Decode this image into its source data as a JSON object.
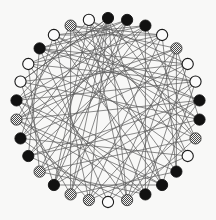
{
  "figure": {
    "background_color": "#f8f8f7",
    "width": 216,
    "height": 220
  },
  "chart_data": {
    "type": "diagram",
    "subtype": "circular-node-link-graph",
    "layout": "circle",
    "center": [
      108,
      110
    ],
    "radius": 92,
    "node_radius": 5.6,
    "node_count": 30,
    "edge_count": 78,
    "grid": false,
    "legend": null,
    "node_styles": {
      "black": {
        "fill": "#111111",
        "stroke": "#111111",
        "label": "solid-black"
      },
      "white": {
        "fill": "#fbfbfb",
        "stroke": "#1a1a1a",
        "label": "open-white"
      },
      "hatched": {
        "fill": "#9a9a9a",
        "stroke": "#3a3a3a",
        "label": "gray-checkered"
      }
    },
    "edge_style": {
      "color": "#5a5a5a",
      "width": 0.7
    },
    "nodes": [
      {
        "id": 0,
        "angle": -90,
        "type": "black",
        "x": 108.0,
        "y": 18.0
      },
      {
        "id": 1,
        "angle": -78,
        "type": "black",
        "x": 127.1,
        "y": 19.9
      },
      {
        "id": 2,
        "angle": -66,
        "type": "black",
        "x": 145.4,
        "y": 25.6
      },
      {
        "id": 3,
        "angle": -54,
        "type": "white",
        "x": 162.1,
        "y": 35.0
      },
      {
        "id": 4,
        "angle": -42,
        "type": "hatched",
        "x": 176.4,
        "y": 48.4
      },
      {
        "id": 5,
        "angle": -30,
        "type": "white",
        "x": 187.7,
        "y": 64.0
      },
      {
        "id": 6,
        "angle": -18,
        "type": "white",
        "x": 195.5,
        "y": 81.6
      },
      {
        "id": 7,
        "angle": -6,
        "type": "black",
        "x": 199.5,
        "y": 100.4
      },
      {
        "id": 8,
        "angle": 6,
        "type": "black",
        "x": 199.5,
        "y": 119.6
      },
      {
        "id": 9,
        "angle": 18,
        "type": "hatched",
        "x": 195.5,
        "y": 138.4
      },
      {
        "id": 10,
        "angle": 30,
        "type": "white",
        "x": 187.7,
        "y": 156.0
      },
      {
        "id": 11,
        "angle": 42,
        "type": "black",
        "x": 176.4,
        "y": 171.6
      },
      {
        "id": 12,
        "angle": 54,
        "type": "black",
        "x": 162.1,
        "y": 185.0
      },
      {
        "id": 13,
        "angle": 66,
        "type": "black",
        "x": 145.4,
        "y": 194.4
      },
      {
        "id": 14,
        "angle": 78,
        "type": "hatched",
        "x": 127.1,
        "y": 200.1
      },
      {
        "id": 15,
        "angle": 90,
        "type": "white",
        "x": 108.0,
        "y": 202.0
      },
      {
        "id": 16,
        "angle": 102,
        "type": "hatched",
        "x": 88.9,
        "y": 200.1
      },
      {
        "id": 17,
        "angle": 114,
        "type": "hatched",
        "x": 70.6,
        "y": 194.4
      },
      {
        "id": 18,
        "angle": 126,
        "type": "black",
        "x": 53.9,
        "y": 185.0
      },
      {
        "id": 19,
        "angle": 138,
        "type": "hatched",
        "x": 39.6,
        "y": 171.6
      },
      {
        "id": 20,
        "angle": 150,
        "type": "black",
        "x": 28.3,
        "y": 156.0
      },
      {
        "id": 21,
        "angle": 162,
        "type": "black",
        "x": 20.5,
        "y": 138.4
      },
      {
        "id": 22,
        "angle": 174,
        "type": "hatched",
        "x": 16.5,
        "y": 119.6
      },
      {
        "id": 23,
        "angle": 186,
        "type": "black",
        "x": 16.5,
        "y": 100.4
      },
      {
        "id": 24,
        "angle": 198,
        "type": "white",
        "x": 20.5,
        "y": 81.6
      },
      {
        "id": 25,
        "angle": 210,
        "type": "white",
        "x": 28.3,
        "y": 64.0
      },
      {
        "id": 26,
        "angle": 222,
        "type": "black",
        "x": 39.6,
        "y": 48.4
      },
      {
        "id": 27,
        "angle": 234,
        "type": "white",
        "x": 53.9,
        "y": 35.0
      },
      {
        "id": 28,
        "angle": 246,
        "type": "hatched",
        "x": 70.6,
        "y": 25.6
      },
      {
        "id": 29,
        "angle": 258,
        "type": "white",
        "x": 88.9,
        "y": 19.9
      }
    ],
    "edges": [
      [
        0,
        9
      ],
      [
        0,
        12
      ],
      [
        0,
        14
      ],
      [
        0,
        16
      ],
      [
        0,
        18
      ],
      [
        0,
        21
      ],
      [
        0,
        24
      ],
      [
        1,
        10
      ],
      [
        1,
        17
      ],
      [
        1,
        22
      ],
      [
        1,
        26
      ],
      [
        2,
        13
      ],
      [
        2,
        19
      ],
      [
        2,
        23
      ],
      [
        2,
        27
      ],
      [
        3,
        11
      ],
      [
        3,
        16
      ],
      [
        3,
        20
      ],
      [
        3,
        25
      ],
      [
        3,
        28
      ],
      [
        4,
        8
      ],
      [
        4,
        14
      ],
      [
        4,
        18
      ],
      [
        4,
        22
      ],
      [
        5,
        13
      ],
      [
        5,
        17
      ],
      [
        5,
        21
      ],
      [
        5,
        26
      ],
      [
        6,
        12
      ],
      [
        6,
        16
      ],
      [
        6,
        19
      ],
      [
        6,
        23
      ],
      [
        6,
        29
      ],
      [
        7,
        14
      ],
      [
        7,
        18
      ],
      [
        7,
        22
      ],
      [
        7,
        27
      ],
      [
        8,
        15
      ],
      [
        8,
        20
      ],
      [
        8,
        24
      ],
      [
        8,
        28
      ],
      [
        9,
        14
      ],
      [
        9,
        19
      ],
      [
        9,
        25
      ],
      [
        10,
        16
      ],
      [
        10,
        21
      ],
      [
        10,
        26
      ],
      [
        11,
        17
      ],
      [
        11,
        23
      ],
      [
        11,
        28
      ],
      [
        12,
        18
      ],
      [
        12,
        22
      ],
      [
        12,
        27
      ],
      [
        12,
        29
      ],
      [
        13,
        19
      ],
      [
        13,
        24
      ],
      [
        13,
        28
      ],
      [
        14,
        20
      ],
      [
        14,
        25
      ],
      [
        14,
        29
      ],
      [
        15,
        21
      ],
      [
        15,
        26
      ],
      [
        16,
        22
      ],
      [
        16,
        27
      ],
      [
        17,
        23
      ],
      [
        17,
        28
      ],
      [
        17,
        0
      ],
      [
        18,
        24
      ],
      [
        18,
        29
      ],
      [
        18,
        1
      ],
      [
        19,
        25
      ],
      [
        19,
        0
      ],
      [
        20,
        26
      ],
      [
        20,
        1
      ],
      [
        21,
        27
      ],
      [
        21,
        2
      ],
      [
        22,
        28
      ],
      [
        22,
        3
      ],
      [
        23,
        29
      ],
      [
        23,
        4
      ],
      [
        24,
        0
      ],
      [
        24,
        5
      ],
      [
        25,
        1
      ],
      [
        25,
        6
      ],
      [
        26,
        2
      ],
      [
        26,
        7
      ],
      [
        27,
        3
      ],
      [
        27,
        8
      ],
      [
        28,
        4
      ],
      [
        28,
        9
      ],
      [
        29,
        5
      ],
      [
        29,
        10
      ],
      [
        2,
        9
      ],
      [
        4,
        11
      ],
      [
        6,
        26
      ],
      [
        13,
        22
      ],
      [
        15,
        4
      ],
      [
        20,
        7
      ],
      [
        23,
        12
      ]
    ]
  }
}
